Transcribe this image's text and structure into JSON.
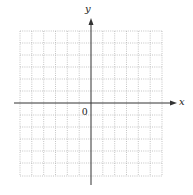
{
  "diagram": {
    "type": "coordinate-grid",
    "axes": {
      "x_label": "x",
      "y_label": "y",
      "origin_label": "0"
    },
    "grid": {
      "columns": 12,
      "rows": 13,
      "line_style": "dotted",
      "line_color": "#b5b5b5"
    },
    "colors": {
      "axis": "#333333",
      "background": "#ffffff"
    }
  }
}
